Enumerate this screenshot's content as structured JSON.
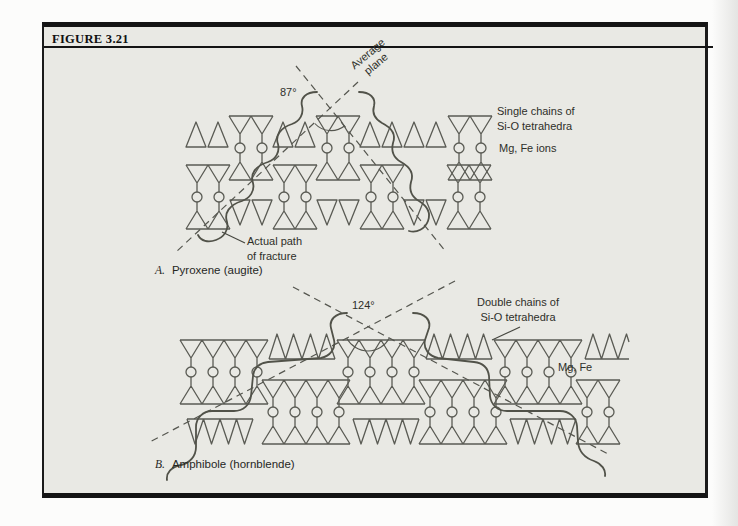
{
  "figure": {
    "label": "FIGURE 3.21"
  },
  "panel_a": {
    "angle": "87°",
    "average_plane": {
      "line1": "Average",
      "line2": "plane"
    },
    "chains_label": {
      "line1": "Single chains of",
      "line2": "Si-O tetrahedra"
    },
    "ions_label": "Mg, Fe ions",
    "fracture_label": {
      "line1": "Actual path",
      "line2": "of fracture"
    },
    "caption": {
      "letter": "A.",
      "text": "Pyroxene (augite)"
    }
  },
  "panel_b": {
    "angle": "124°",
    "chains_label": {
      "line1": "Double chains of",
      "line2": "Si-O tetrahedra"
    },
    "ions_label": "Mg, Fe",
    "caption": {
      "letter": "B.",
      "text": "Amphibole (hornblende)"
    }
  },
  "colors": {
    "figure_background": "#e9e9e4",
    "line": "#5a5b54",
    "border": "#141414",
    "page": "#fcfcfb"
  }
}
